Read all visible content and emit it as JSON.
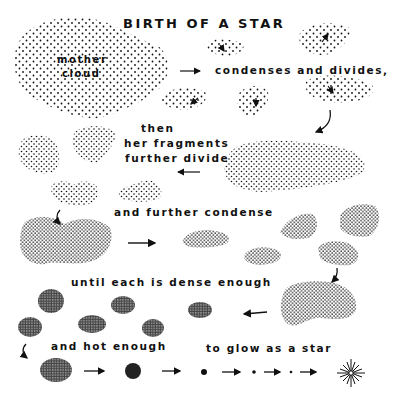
{
  "title": "BIRTH OF A STAR",
  "captions": {
    "mother_cloud_1": "mother",
    "mother_cloud_2": "cloud",
    "step1": "condenses and divides,",
    "step2_1": "then",
    "step2_2": "her fragments",
    "step2_3": "further divide",
    "step3": "and further condense",
    "step4": "until each is dense enough",
    "step5": "and hot enough",
    "step6": "to glow as a star"
  },
  "colors": {
    "ink": "#111111",
    "paper": "#ffffff"
  },
  "icons": {
    "arrow": "arrow-icon",
    "star": "star-burst-icon",
    "curved_arrow": "curved-arrow-icon"
  }
}
